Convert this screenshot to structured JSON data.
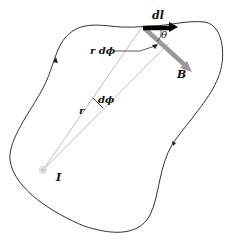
{
  "diagram": {
    "labels": {
      "dl": "dl",
      "theta": "θ",
      "B": "B",
      "r_dphi": "r dϕ",
      "r": "r",
      "dphi": "dϕ",
      "I": "I"
    },
    "colors": {
      "loop": "#333333",
      "dl_vector": "#000000",
      "B_vector": "#999999",
      "radial_lines": "#b5b5b5",
      "current_point": "#c8c8c8"
    }
  }
}
